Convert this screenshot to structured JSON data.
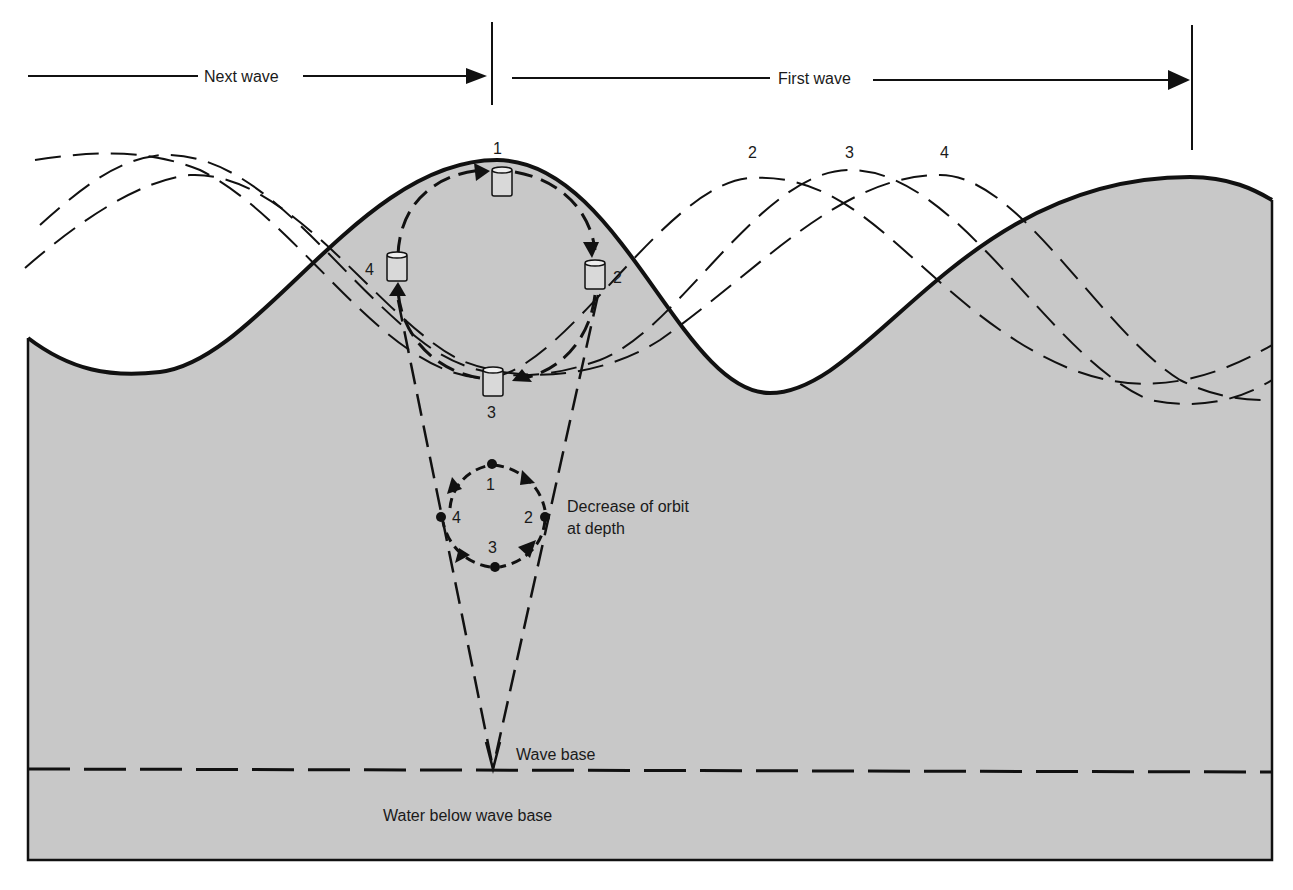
{
  "diagram": {
    "title_arrows": {
      "next_wave": "Next wave",
      "first_wave": "First wave"
    },
    "surface_positions": {
      "float_positions": [
        "1",
        "2",
        "3",
        "4"
      ],
      "wave_positions_labels": [
        "2",
        "3",
        "4"
      ]
    },
    "deep_orbit": {
      "positions": [
        "1",
        "2",
        "3",
        "4"
      ],
      "label_line1": "Decrease of orbit",
      "label_line2": "at depth"
    },
    "wave_base_label": "Wave base",
    "below_label": "Water below wave base",
    "colors": {
      "water": "#c8c8c8",
      "line": "#111111",
      "background": "#ffffff"
    }
  }
}
